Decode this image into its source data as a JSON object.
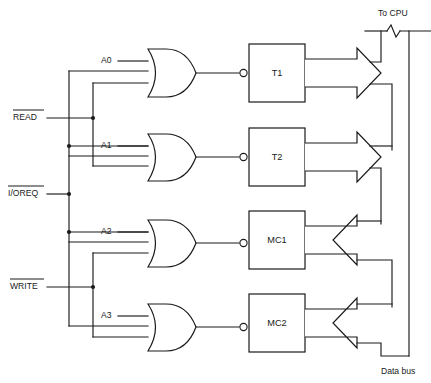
{
  "diagram": {
    "type": "logic-schematic",
    "background_color": "#ffffff",
    "line_color": "#1a1a1a",
    "control_inputs": [
      {
        "id": "read",
        "label": "READ",
        "overbar": true,
        "y": 118
      },
      {
        "id": "ioreq",
        "label": "I/OREQ",
        "overbar": true,
        "y": 194
      },
      {
        "id": "write",
        "label": "WRITE",
        "overbar": true,
        "y": 287
      }
    ],
    "address_inputs": [
      {
        "id": "a0",
        "label": "A0",
        "y": 61
      },
      {
        "id": "a1",
        "label": "A1",
        "y": 146
      },
      {
        "id": "a2",
        "label": "A2",
        "y": 232
      },
      {
        "id": "a3",
        "label": "A3",
        "y": 316
      }
    ],
    "gates": [
      {
        "id": "gate-a0",
        "type": "or",
        "inputs": 3,
        "output_inverted": true,
        "label": "A0"
      },
      {
        "id": "gate-a1",
        "type": "or",
        "inputs": 3,
        "output_inverted": true,
        "label": "A1"
      },
      {
        "id": "gate-a2",
        "type": "or",
        "inputs": 3,
        "output_inverted": true,
        "label": "A2"
      },
      {
        "id": "gate-a3",
        "type": "or",
        "inputs": 3,
        "output_inverted": true,
        "label": "A3"
      }
    ],
    "blocks": [
      {
        "id": "t1",
        "label": "T1",
        "x": 249,
        "y": 44,
        "w": 56,
        "h": 58,
        "bus_direction": "out"
      },
      {
        "id": "t2",
        "label": "T2",
        "x": 249,
        "y": 128,
        "w": 56,
        "h": 58,
        "bus_direction": "out"
      },
      {
        "id": "mc1",
        "label": "MC1",
        "x": 249,
        "y": 211,
        "w": 56,
        "h": 58,
        "bus_direction": "in"
      },
      {
        "id": "mc2",
        "label": "MC2",
        "x": 249,
        "y": 294,
        "w": 56,
        "h": 58,
        "bus_direction": "in"
      }
    ],
    "bus_labels": [
      {
        "id": "to-cpu",
        "text": "To CPU",
        "x": 378,
        "y": 14
      },
      {
        "id": "data-bus",
        "text": "Data bus",
        "x": 381,
        "y": 372
      }
    ],
    "annotations": {
      "bus_break_symbol": "zigzag",
      "gate_output_marker": "inverting-bubble"
    }
  }
}
